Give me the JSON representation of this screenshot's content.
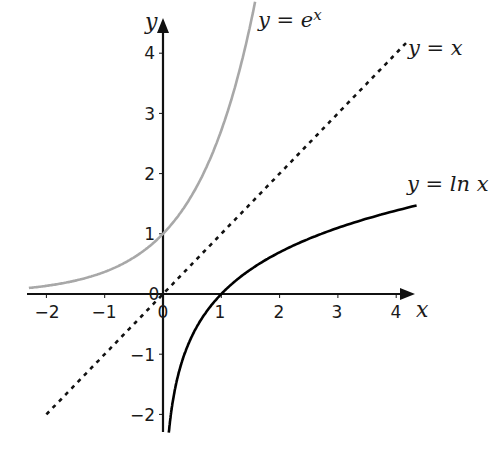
{
  "chart_data": {
    "type": "line",
    "title": "",
    "xlabel": "x",
    "ylabel": "y",
    "xlim": [
      -2.3,
      4.3
    ],
    "ylim": [
      -2.3,
      4.4
    ],
    "grid": false,
    "x_ticks": [
      -2,
      -1,
      0,
      1,
      2,
      3,
      4
    ],
    "y_ticks": [
      -2,
      -1,
      1,
      2,
      3,
      4
    ],
    "origin_label": "0",
    "series": [
      {
        "name": "y = e^x",
        "label_base": "y = e",
        "label_sup": "x",
        "style": "solid",
        "color": "#a8a8a8",
        "function": "exp",
        "x_range": [
          -2.3,
          1.58
        ]
      },
      {
        "name": "y = x",
        "label": "y = x",
        "style": "dashed",
        "color": "#111111",
        "function": "identity",
        "x_range": [
          -2.0,
          4.2
        ]
      },
      {
        "name": "y = ln x",
        "label": "y = ln x",
        "style": "solid",
        "color": "#000000",
        "function": "ln",
        "x_range": [
          0.1,
          4.35
        ]
      }
    ]
  },
  "axes": {
    "x_name": "x",
    "y_name": "y",
    "x_tick_labels": [
      "−2",
      "−1",
      "0",
      "1",
      "2",
      "3",
      "4"
    ],
    "y_tick_labels": [
      "4",
      "3",
      "2",
      "1",
      "−1",
      "−2"
    ],
    "origin_label": "0"
  },
  "labels": {
    "exp_base": "y = e",
    "exp_sup": "x",
    "identity": "y = x",
    "ln": "y = ln x"
  }
}
